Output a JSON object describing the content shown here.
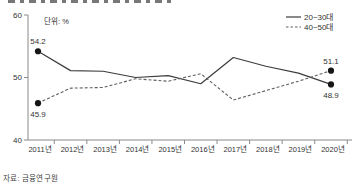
{
  "page": {
    "source": "자료: 금융연구원"
  },
  "chart_data": {
    "type": "line",
    "title": "",
    "unit_label": "단위: %",
    "categories": [
      "2011년",
      "2012년",
      "2013년",
      "2014년",
      "2015년",
      "2016년",
      "2017년",
      "2018년",
      "2019년",
      "2020년"
    ],
    "series": [
      {
        "name": "20~30대",
        "style": "solid",
        "color": "#3c3c3c",
        "values": [
          54.2,
          51.1,
          51.0,
          50.0,
          50.3,
          49.0,
          53.2,
          51.8,
          50.7,
          48.9
        ],
        "first_label": "54.2",
        "last_label": "48.9",
        "first_label_pos": "above",
        "last_label_pos": "below"
      },
      {
        "name": "40~50대",
        "style": "dashed",
        "color": "#5f5f5f",
        "values": [
          45.9,
          48.3,
          48.4,
          49.8,
          49.4,
          50.6,
          46.4,
          47.9,
          49.4,
          51.1
        ],
        "first_label": "45.9",
        "last_label": "51.1",
        "first_label_pos": "below",
        "last_label_pos": "above"
      }
    ],
    "xlabel": "",
    "ylabel": "",
    "ylim": [
      40,
      60
    ],
    "y_ticks": [
      40,
      50,
      60
    ],
    "grid": false,
    "legend_position": "top-right",
    "marker_color": "#161616",
    "axis_color": "#8a8a8a",
    "text_color": "#333333"
  }
}
